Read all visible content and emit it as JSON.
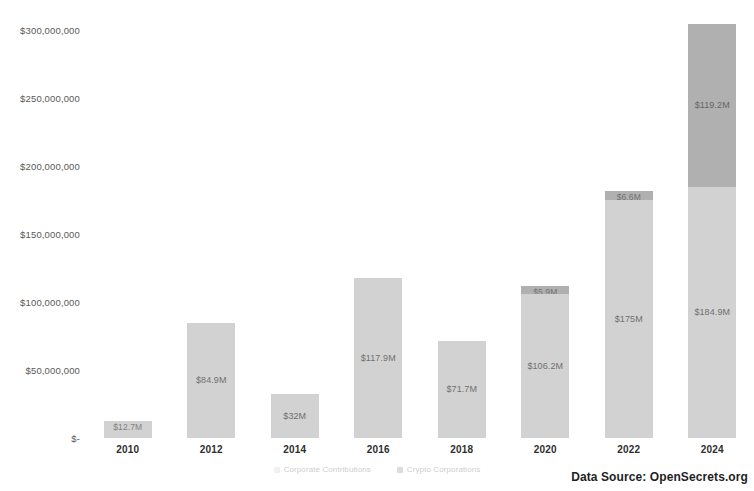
{
  "chart_data": {
    "type": "bar",
    "title": "",
    "subtitle": "",
    "xlabel": "",
    "ylabel": "",
    "stacked": true,
    "grid": false,
    "legend_position": "bottom-center",
    "categories": [
      "2010",
      "2012",
      "2014",
      "2016",
      "2018",
      "2020",
      "2022",
      "2024"
    ],
    "ylim": [
      0,
      300000000
    ],
    "ytick_values": [
      0,
      50000000,
      100000000,
      150000000,
      200000000,
      250000000,
      300000000
    ],
    "ytick_labels": [
      "$-",
      "$50,000,000",
      "$100,000,000",
      "$150,000,000",
      "$200,000,000",
      "$250,000,000",
      "$300,000,000"
    ],
    "series": [
      {
        "name": "Corporate Contributions",
        "color": "#d2d2d2",
        "values": [
          12700000,
          84900000,
          32000000,
          117900000,
          71700000,
          106200000,
          175000000,
          184900000
        ],
        "data_labels": [
          "$12.7M",
          "$84.9M",
          "$32M",
          "$117.9M",
          "$71.7M",
          "$106.2M",
          "$175M",
          "$184.9M"
        ]
      },
      {
        "name": "Crypto Corporations",
        "color": "#b0b0b0",
        "values": [
          0,
          0,
          0,
          0,
          0,
          5900000,
          6600000,
          119200000
        ],
        "data_labels": [
          "",
          "",
          "",
          "",
          "",
          "$5.9M",
          "$6.6M",
          "$119.2M"
        ]
      }
    ],
    "annotations": [
      "Data Source: OpenSecrets.org"
    ]
  },
  "legend": {
    "items": [
      {
        "label": "Corporate Contributions",
        "swatch": "base"
      },
      {
        "label": "Crypto Corporations",
        "swatch": "crypto"
      }
    ]
  },
  "footer": {
    "source_text": "Data Source: OpenSecrets.org"
  }
}
